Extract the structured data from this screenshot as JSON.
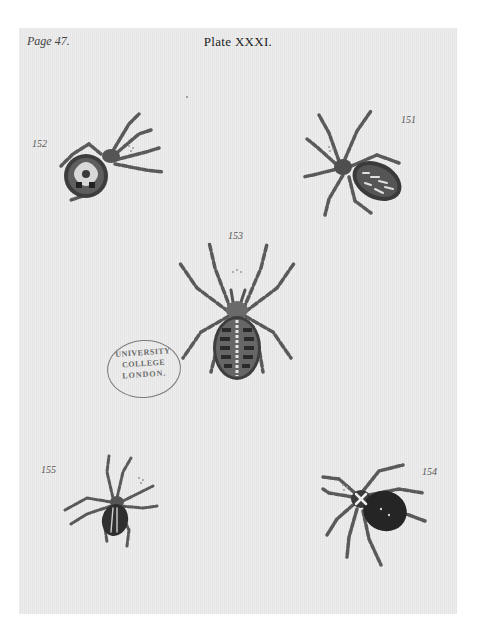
{
  "plate": {
    "page_ref": "Page 47.",
    "title": "Plate XXXI."
  },
  "figures": [
    {
      "number": "151",
      "subject": "spider",
      "pattern": "striped-elongate-abdomen"
    },
    {
      "number": "152",
      "subject": "spider",
      "pattern": "round-abdomen-with-pale-emblem"
    },
    {
      "number": "153",
      "subject": "spider",
      "pattern": "banded-oval-abdomen-with-central-stripe"
    },
    {
      "number": "154",
      "subject": "spider",
      "pattern": "dark-abdomen-with-white-cross"
    },
    {
      "number": "155",
      "subject": "spider",
      "pattern": "small-striped-abdomen"
    }
  ],
  "stamp": {
    "line1": "UNIVERSITY",
    "line2": "COLLEGE",
    "line3": "LONDON."
  },
  "colors": {
    "background": "#ffffff",
    "paper": "#e9e9e9",
    "ink_dark": "#2a2a2a",
    "ink_mid": "#6b6b6b",
    "stamp_ink": "#6a6a6a"
  }
}
